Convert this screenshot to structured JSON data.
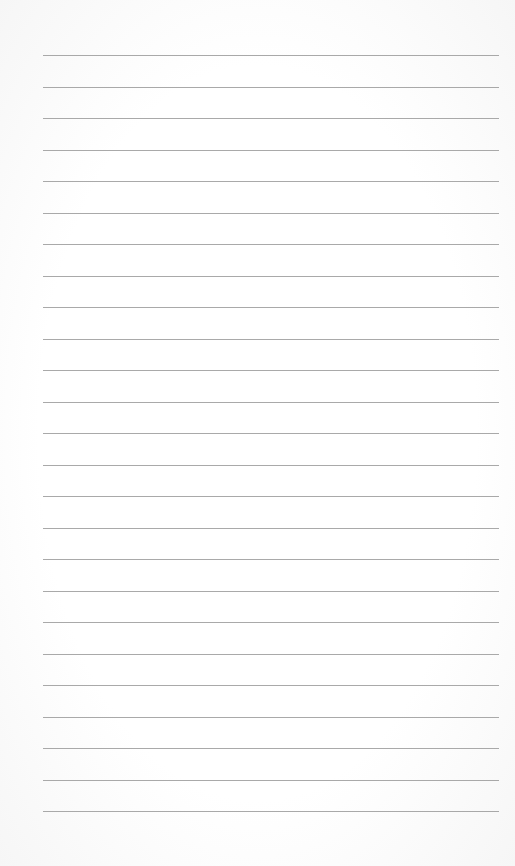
{
  "document": {
    "type": "lined-paper",
    "line_count": 25,
    "first_line_y": 55,
    "line_spacing": 31.5,
    "line_color": "#9a9a9a",
    "background_color": "#fdfdfd",
    "text": ""
  }
}
